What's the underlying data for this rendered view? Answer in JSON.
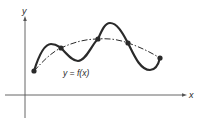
{
  "diagram": {
    "axes": {
      "x_label": "x",
      "y_label": "y"
    },
    "curve_label": "y = f(x)",
    "colors": {
      "stroke": "#2a2a2a",
      "axis": "#555555",
      "background": "#ffffff"
    },
    "solid_curve": {
      "description": "wavy function y = f(x)",
      "path": "M34,71 C38,58 44,44 51,44 C57,44 59,47 61,48 C67,54 72,61 78,61 C86,61 92,44 98,39 C102,30 105,23 110,23 C118,23 124,36 128,43 C134,55 140,70 150,70 C156,70 159,62 160,58"
    },
    "dashed_curve": {
      "description": "smooth approximating curve through intersection points",
      "path": "M34,71 C44,60 52,52 61,48 C74,42 86,39 98,39 C110,38 120,40 128,43 C140,47 150,52 160,58"
    },
    "points": [
      {
        "x": 34,
        "y": 71
      },
      {
        "x": 61,
        "y": 48
      },
      {
        "x": 98,
        "y": 39
      },
      {
        "x": 128,
        "y": 43
      },
      {
        "x": 160,
        "y": 58
      }
    ]
  }
}
